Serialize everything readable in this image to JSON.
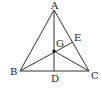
{
  "diagram": {
    "type": "geometry-triangle",
    "points": {
      "A": {
        "label": "A",
        "x": 54,
        "y": 10
      },
      "B": {
        "label": "B",
        "x": 20,
        "y": 71
      },
      "C": {
        "label": "C",
        "x": 89,
        "y": 71
      },
      "D": {
        "label": "D",
        "x": 54,
        "y": 71
      },
      "E": {
        "label": "E",
        "x": 73,
        "y": 42
      },
      "G": {
        "label": "G",
        "x": 54,
        "y": 51
      }
    },
    "segments": [
      "AB",
      "AC",
      "BC",
      "AD",
      "BE",
      "CG"
    ],
    "labels": {
      "A": "A",
      "B": "B",
      "C": "C",
      "D": "D",
      "E": "E",
      "G": "G"
    },
    "colors": {
      "line": "#333333",
      "text": "#222222",
      "point": "#000000"
    }
  }
}
